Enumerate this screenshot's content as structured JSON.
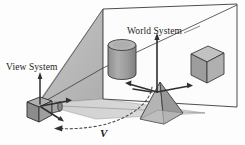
{
  "figure": {
    "width": 245,
    "height": 145,
    "background_color": "#fdfdfd"
  },
  "labels": {
    "view_system": "View System",
    "world_system": "World System",
    "velocity": "V"
  },
  "colors": {
    "stroke": "#2b2b2b",
    "far_plane_fill": "#fbfbfb",
    "frustum_side_fill": "#b9b9b9",
    "frustum_ground_fill": "#d7d7d7",
    "object_light": "#bdbdbd",
    "object_mid": "#a3a3a3",
    "object_dark": "#8a8a8a",
    "camera_body": "#9e9e9e",
    "camera_shadow": "#7a7a7a",
    "axis_color": "#3a3a3a",
    "dashed_path": "#555555"
  },
  "scene": {
    "far_plane": {
      "name": "far-clipping-plane",
      "points": "103,9 237,4 237,107 103,99"
    },
    "frustum_side": {
      "name": "frustum-upper-face",
      "points": "38,103 103,9 103,99"
    },
    "frustum_ground": {
      "name": "frustum-ground-face",
      "points": "38,103 103,99 203,114 92,118"
    },
    "diagonal_line": {
      "name": "frustum-diagonal-edge",
      "points": "38,103 237,4"
    },
    "objects": [
      {
        "name": "cylinder",
        "label": "cylinder-object",
        "cx": 122,
        "cy": 58
      },
      {
        "name": "cube",
        "label": "cube-object",
        "cx": 205,
        "cy": 63
      },
      {
        "name": "pyramid",
        "label": "pyramid-object",
        "cx": 160,
        "cy": 105
      }
    ],
    "world_axes": {
      "name": "world-coordinate-axes",
      "origin_x": 157,
      "origin_y": 92,
      "up_tip_y": 36,
      "left_tip_x": 127,
      "right_tip_x": 190
    },
    "view_axes": {
      "name": "view-coordinate-axes",
      "origin_x": 42,
      "origin_y": 108,
      "up_tip_y": 73
    },
    "camera": {
      "name": "camera-body",
      "x": 27,
      "y": 100,
      "width": 22,
      "height": 17
    },
    "motion_path": {
      "name": "camera-motion-arc",
      "description": "dashed arc with leftward arrowhead"
    }
  }
}
